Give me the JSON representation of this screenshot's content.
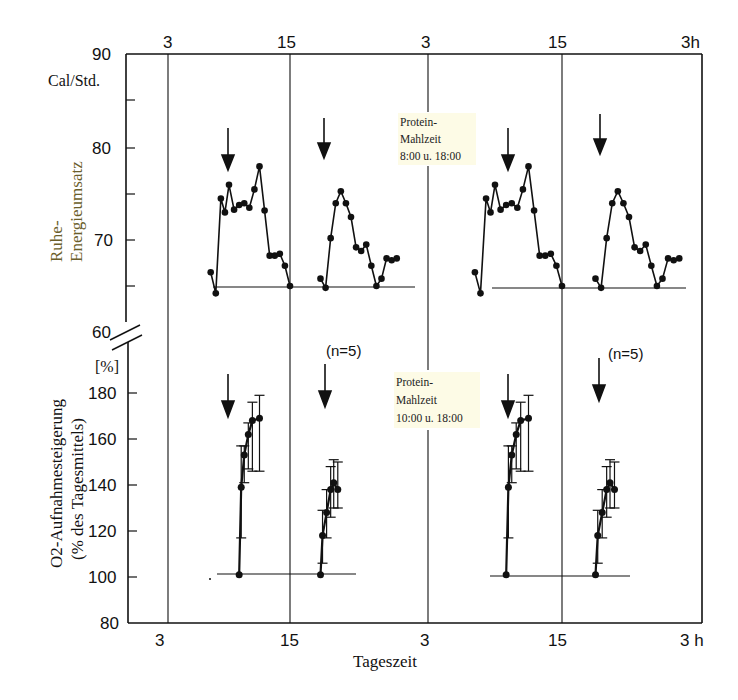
{
  "chart_data": [
    {
      "type": "line",
      "panel": "top",
      "title": "",
      "ylabel": "Ruhe-Energieumsatz",
      "yunit": "Cal/Std.",
      "ylim": [
        60,
        90
      ],
      "yticks": [
        "90",
        "80",
        "70",
        "60"
      ],
      "xlabel": "Tageszeit",
      "xticks": [
        "3",
        "15",
        "3",
        "15",
        "3h"
      ],
      "annotation": [
        "Protein-",
        "Mahlzeit",
        "8:00 u. 18:00"
      ],
      "baseline": 65,
      "meal_arrows": [
        "8:00",
        "18:00",
        "8:00",
        "18:00"
      ],
      "series": [
        {
          "name": "Day 1 - meal 1",
          "x": [
            7.2,
            7.7,
            8.2,
            8.6,
            9.0,
            9.5,
            10.0,
            10.5,
            11.0,
            11.5,
            12.0,
            12.5,
            13.0,
            13.5,
            14.0,
            14.5,
            15.0,
            15.5,
            16.0
          ],
          "values": [
            66.5,
            64.2,
            74.5,
            73.0,
            76.0,
            73.3,
            73.8,
            74.0,
            73.5,
            75.5,
            78.0,
            73.2,
            68.3,
            68.3,
            68.5,
            67.2,
            65.0,
            null,
            null
          ]
        },
        {
          "name": "Day 1 - meal 2",
          "x": [
            18.0,
            18.5,
            19.0,
            19.5,
            20.0,
            20.5,
            21.0,
            21.5,
            22.0,
            22.5,
            23.0,
            23.5,
            24.0,
            24.5,
            25.0,
            25.5
          ],
          "values": [
            65.8,
            64.8,
            70.2,
            74.0,
            75.3,
            74.0,
            72.5,
            69.2,
            68.8,
            69.5,
            67.2,
            65.0,
            65.8,
            68.0,
            67.8,
            68.0
          ]
        },
        {
          "name": "Day 2 - meal 1",
          "x": [
            7.2,
            7.7,
            8.2,
            8.6,
            9.0,
            9.5,
            10.0,
            10.5,
            11.0,
            11.5,
            12.0,
            12.5,
            13.0,
            13.5,
            14.0,
            14.5,
            15.0
          ],
          "values": [
            66.5,
            64.2,
            74.5,
            73.0,
            76.0,
            73.3,
            73.8,
            74.0,
            73.5,
            75.5,
            78.0,
            73.2,
            68.3,
            68.3,
            68.5,
            67.2,
            65.0
          ]
        },
        {
          "name": "Day 2 - meal 2",
          "x": [
            18.0,
            18.5,
            19.0,
            19.5,
            20.0,
            20.5,
            21.0,
            21.5,
            22.0,
            22.5,
            23.0,
            23.5,
            24.0,
            24.5,
            25.0,
            25.5
          ],
          "values": [
            65.8,
            64.8,
            70.2,
            74.0,
            75.3,
            74.0,
            72.5,
            69.2,
            68.8,
            69.5,
            67.2,
            65.0,
            65.8,
            68.0,
            67.8,
            68.0
          ]
        }
      ]
    },
    {
      "type": "line",
      "panel": "bottom",
      "ylabel": "O2-Aufnahmesteigerung (% des Tagesmittels)",
      "yunit": "[%]",
      "ylim": [
        80,
        190
      ],
      "yticks": [
        "180",
        "160",
        "140",
        "120",
        "100",
        "80"
      ],
      "xlabel": "Tageszeit",
      "xticks": [
        "3",
        "15",
        "3",
        "15",
        "3h"
      ],
      "annotation": [
        "Protein-",
        "Mahlzeit",
        "10:00 u. 18:00"
      ],
      "n_label": "(n=5)",
      "baseline": 101,
      "series": [
        {
          "name": "Day 1 - meal 1 (10:00)",
          "x": [
            10.0,
            10.2,
            10.5,
            10.9,
            11.3,
            12.0
          ],
          "values": [
            101,
            139,
            153,
            162,
            168,
            169
          ],
          "err_low": [
            101,
            117,
            141,
            147,
            146,
            146
          ],
          "err_high": [
            101,
            157,
            157,
            167,
            176,
            179
          ]
        },
        {
          "name": "Day 1 - meal 2 (18:00)",
          "x": [
            18.0,
            18.2,
            18.6,
            19.0,
            19.3,
            19.7
          ],
          "values": [
            101,
            118,
            128,
            138,
            141,
            138
          ],
          "err_low": [
            101,
            106,
            117,
            126,
            130,
            130
          ],
          "err_high": [
            101,
            129,
            138,
            148,
            151,
            150
          ]
        },
        {
          "name": "Day 2 - meal 1 (10:00)",
          "x": [
            10.0,
            10.2,
            10.5,
            10.9,
            11.3,
            12.0
          ],
          "values": [
            101,
            139,
            153,
            162,
            168,
            169
          ],
          "err_low": [
            101,
            117,
            141,
            147,
            146,
            146
          ],
          "err_high": [
            101,
            157,
            157,
            167,
            176,
            179
          ]
        },
        {
          "name": "Day 2 - meal 2 (18:00)",
          "x": [
            18.0,
            18.2,
            18.6,
            19.0,
            19.3,
            19.7
          ],
          "values": [
            101,
            118,
            128,
            138,
            141,
            138
          ],
          "err_low": [
            101,
            106,
            117,
            126,
            130,
            130
          ],
          "err_high": [
            101,
            129,
            138,
            148,
            151,
            150
          ]
        }
      ]
    }
  ],
  "labels": {
    "top_xticks": [
      "3",
      "15",
      "3",
      "15",
      "3h"
    ],
    "bottom_xticks": [
      "3",
      "15",
      "3",
      "15",
      "3 h"
    ],
    "xlabel": "Tageszeit",
    "top_yunit": "Cal/Std.",
    "top_yticks": [
      "90",
      "80",
      "70",
      "60"
    ],
    "top_ylabel_1": "Ruhe-",
    "top_ylabel_2": "Energieumsatz",
    "bottom_yunit": "[%]",
    "bottom_yticks": [
      "180",
      "160",
      "140",
      "120",
      "100",
      "80"
    ],
    "bottom_ylabel_1": "O2-Aufnahmesteigerung",
    "bottom_ylabel_2": "(% des Tagesmittels)",
    "top_annotation": [
      "Protein-",
      "Mahlzeit",
      "8:00 u. 18:00"
    ],
    "bottom_annotation": [
      "Protein-",
      "Mahlzeit",
      "10:00 u. 18:00"
    ],
    "n_label_1": "(n=5)",
    "n_label_2": "(n=5)"
  },
  "colors": {
    "ink": "#111111",
    "ylabel_top": "#6b5e2a",
    "annotation_highlight": "#fdfbe6"
  }
}
